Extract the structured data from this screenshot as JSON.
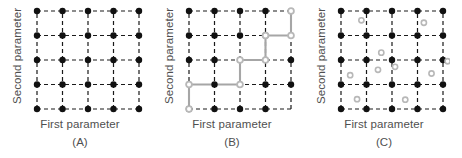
{
  "figure": {
    "width": 462,
    "height": 158,
    "background": "#ffffff"
  },
  "style": {
    "grid_line_color": "#1a1a1a",
    "grid_dash": "4,3",
    "black_node_color": "#111111",
    "gray_node_color": "#b8b8b8",
    "gray_path_color": "#a6a6a6",
    "text_color": "#4f4f4f"
  },
  "panels": [
    {
      "id": "A",
      "letter": "(A)",
      "xlabel": "First parameter",
      "ylabel": "Second parameter",
      "grid": {
        "cols": 5,
        "rows": 5
      },
      "nodes_black": [
        [
          0,
          0
        ],
        [
          1,
          0
        ],
        [
          2,
          0
        ],
        [
          3,
          0
        ],
        [
          4,
          0
        ],
        [
          0,
          1
        ],
        [
          1,
          1
        ],
        [
          2,
          1
        ],
        [
          3,
          1
        ],
        [
          4,
          1
        ],
        [
          0,
          2
        ],
        [
          1,
          2
        ],
        [
          2,
          2
        ],
        [
          3,
          2
        ],
        [
          4,
          2
        ],
        [
          0,
          3
        ],
        [
          1,
          3
        ],
        [
          2,
          3
        ],
        [
          3,
          3
        ],
        [
          4,
          3
        ],
        [
          0,
          4
        ],
        [
          1,
          4
        ],
        [
          2,
          4
        ],
        [
          3,
          4
        ],
        [
          4,
          4
        ]
      ],
      "nodes_gray": [],
      "path": [],
      "scatter_gray": []
    },
    {
      "id": "B",
      "letter": "(B)",
      "xlabel": "First parameter",
      "ylabel": "Second parameter",
      "grid": {
        "cols": 5,
        "rows": 5
      },
      "nodes_black": [
        [
          0,
          0
        ],
        [
          1,
          0
        ],
        [
          2,
          0
        ],
        [
          3,
          0
        ],
        [
          1,
          1
        ],
        [
          3,
          1
        ],
        [
          4,
          1
        ],
        [
          0,
          2
        ],
        [
          1,
          2
        ],
        [
          4,
          2
        ],
        [
          0,
          3
        ],
        [
          1,
          3
        ],
        [
          2,
          3
        ],
        [
          3,
          3
        ],
        [
          0,
          4
        ],
        [
          1,
          4
        ],
        [
          2,
          4
        ],
        [
          3,
          4
        ]
      ],
      "nodes_gray": [
        [
          0,
          0
        ],
        [
          0,
          1
        ],
        [
          2,
          1
        ],
        [
          2,
          2
        ],
        [
          3,
          2
        ],
        [
          3,
          3
        ],
        [
          4,
          3
        ],
        [
          4,
          4
        ]
      ],
      "path": [
        [
          0,
          0
        ],
        [
          0,
          1
        ],
        [
          2,
          1
        ],
        [
          2,
          2
        ],
        [
          3,
          2
        ],
        [
          3,
          3
        ],
        [
          4,
          3
        ],
        [
          4,
          4
        ]
      ],
      "scatter_gray": []
    },
    {
      "id": "C",
      "letter": "(C)",
      "xlabel": "First parameter",
      "ylabel": "Second parameter",
      "grid": {
        "cols": 5,
        "rows": 5
      },
      "nodes_black": [
        [
          0,
          0
        ],
        [
          1,
          0
        ],
        [
          2,
          0
        ],
        [
          3,
          0
        ],
        [
          4,
          0
        ],
        [
          0,
          1
        ],
        [
          1,
          1
        ],
        [
          2,
          1
        ],
        [
          3,
          1
        ],
        [
          4,
          1
        ],
        [
          0,
          2
        ],
        [
          1,
          2
        ],
        [
          2,
          2
        ],
        [
          3,
          2
        ],
        [
          4,
          2
        ],
        [
          0,
          3
        ],
        [
          1,
          3
        ],
        [
          2,
          3
        ],
        [
          3,
          3
        ],
        [
          4,
          3
        ],
        [
          0,
          4
        ],
        [
          1,
          4
        ],
        [
          2,
          4
        ],
        [
          3,
          4
        ],
        [
          4,
          4
        ]
      ],
      "nodes_gray": [],
      "path": [],
      "scatter_gray": [
        [
          0.63,
          0.4
        ],
        [
          0.36,
          1.38
        ],
        [
          1.45,
          1.6
        ],
        [
          1.58,
          2.3
        ],
        [
          2.12,
          1.72
        ],
        [
          2.52,
          0.38
        ],
        [
          3.25,
          3.52
        ],
        [
          3.55,
          1.45
        ],
        [
          4.18,
          1.95
        ],
        [
          0.8,
          3.62
        ]
      ]
    }
  ],
  "chart_data": {
    "type": "scatter",
    "title": "",
    "xlabel": "First parameter",
    "ylabel": "Second parameter",
    "xlim": [
      0,
      4
    ],
    "ylim": [
      0,
      4
    ],
    "grid": true,
    "legend": null,
    "series": [
      {
        "name": "Full factorial grid (A)",
        "panel": "A",
        "marker": "filled-circle",
        "color": "#111111",
        "x": [
          0,
          1,
          2,
          3,
          4,
          0,
          1,
          2,
          3,
          4,
          0,
          1,
          2,
          3,
          4,
          0,
          1,
          2,
          3,
          4,
          0,
          1,
          2,
          3,
          4
        ],
        "y": [
          0,
          0,
          0,
          0,
          0,
          1,
          1,
          1,
          1,
          1,
          2,
          2,
          2,
          2,
          2,
          3,
          3,
          3,
          3,
          3,
          4,
          4,
          4,
          4,
          4
        ]
      },
      {
        "name": "Staircase path (B)",
        "panel": "B",
        "marker": "open-circle",
        "color": "#a6a6a6",
        "x": [
          0,
          0,
          2,
          2,
          3,
          3,
          4,
          4
        ],
        "y": [
          0,
          1,
          1,
          2,
          2,
          3,
          3,
          4
        ]
      },
      {
        "name": "Random sampling (C)",
        "panel": "C",
        "marker": "open-circle",
        "color": "#b8b8b8",
        "x": [
          0.63,
          0.36,
          1.45,
          1.58,
          2.12,
          2.52,
          3.25,
          3.55,
          4.18,
          0.8
        ],
        "y": [
          0.4,
          1.38,
          1.6,
          2.3,
          1.72,
          0.38,
          3.52,
          1.45,
          1.95,
          3.62
        ]
      }
    ]
  }
}
